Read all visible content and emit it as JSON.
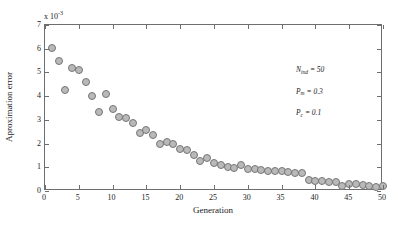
{
  "chart_data": {
    "type": "scatter",
    "title": "",
    "xlabel": "Generation",
    "ylabel": "Aproximation error",
    "y_exponent_prefix": "x 10",
    "y_exponent_value": "-3",
    "xlim": [
      0,
      50
    ],
    "ylim": [
      0,
      7
    ],
    "grid": false,
    "legend": null,
    "xticks": [
      0,
      5,
      10,
      15,
      20,
      25,
      30,
      35,
      40,
      45,
      50
    ],
    "xticklabels": [
      "0",
      "5",
      "10",
      "15",
      "20",
      "25",
      "30",
      "35",
      "40",
      "45",
      "50"
    ],
    "yticks": [
      0,
      1,
      2,
      3,
      4,
      5,
      6,
      7
    ],
    "yticklabels": [
      "0",
      "1",
      "2",
      "3",
      "4",
      "5",
      "6",
      "7"
    ],
    "marker_fill": "#b9b9b9",
    "marker_edge": "#767676",
    "axis_color": "#6e6e6e",
    "x": [
      1,
      2,
      3,
      4,
      5,
      6,
      7,
      8,
      9,
      10,
      11,
      12,
      13,
      14,
      15,
      16,
      17,
      18,
      19,
      20,
      21,
      22,
      23,
      24,
      25,
      26,
      27,
      28,
      29,
      30,
      31,
      32,
      33,
      34,
      35,
      36,
      37,
      38,
      39,
      40,
      41,
      42,
      43,
      44,
      45,
      46,
      47,
      48,
      49,
      50
    ],
    "values": [
      6.05,
      5.48,
      4.26,
      5.18,
      5.12,
      4.6,
      4.02,
      3.34,
      4.1,
      3.44,
      3.12,
      3.08,
      2.86,
      2.44,
      2.58,
      2.38,
      2.0,
      2.05,
      2.0,
      1.76,
      1.74,
      1.52,
      1.28,
      1.4,
      1.16,
      1.1,
      1.0,
      0.98,
      1.08,
      0.92,
      0.92,
      0.88,
      0.85,
      0.84,
      0.86,
      0.8,
      0.74,
      0.74,
      0.46,
      0.44,
      0.42,
      0.4,
      0.36,
      0.22,
      0.3,
      0.28,
      0.26,
      0.2,
      0.16,
      0.22
    ]
  },
  "annotations": {
    "n_ind": {
      "symbol": "N",
      "sub": "ind",
      "eq": " = 50"
    },
    "p_m": {
      "symbol": "P",
      "sub": "m",
      "eq": " = 0.3"
    },
    "p_c": {
      "symbol": "P",
      "sub": "c",
      "eq": " = 0.1"
    }
  }
}
